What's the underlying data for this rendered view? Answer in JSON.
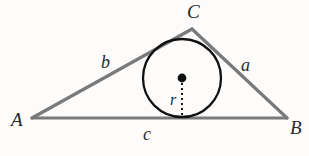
{
  "figure": {
    "kind": "geometry-diagram",
    "background_color": "#fdfcfb"
  },
  "labels": {
    "vertex_A": "A",
    "vertex_B": "B",
    "vertex_C": "C",
    "side_a": "a",
    "side_b": "b",
    "side_c": "c",
    "radius": "r"
  },
  "geometry": {
    "triangle": {
      "A": {
        "x": 32,
        "y": 118
      },
      "B": {
        "x": 287,
        "y": 118
      },
      "C": {
        "x": 192,
        "y": 29
      },
      "stroke_color": "#7a7a7a",
      "stroke_width": 3
    },
    "incircle": {
      "center": {
        "x": 182,
        "y": 78
      },
      "radius": 39,
      "stroke_color": "#111111",
      "stroke_width": 2.2,
      "fill": "none"
    },
    "center_dot": {
      "x": 182,
      "y": 78,
      "radius": 4.2,
      "color": "#111111"
    },
    "radius_line": {
      "from": {
        "x": 182,
        "y": 78
      },
      "to": {
        "x": 182,
        "y": 117
      },
      "style": "dashed",
      "stroke_color": "#1a1a1a",
      "stroke_width": 2,
      "dash_pattern": "2 3"
    }
  },
  "colors": {
    "ink": "#2a2a2a",
    "triangle_gray": "#7a7a7a",
    "circle_black": "#111111",
    "page": "#fdfcfb"
  }
}
